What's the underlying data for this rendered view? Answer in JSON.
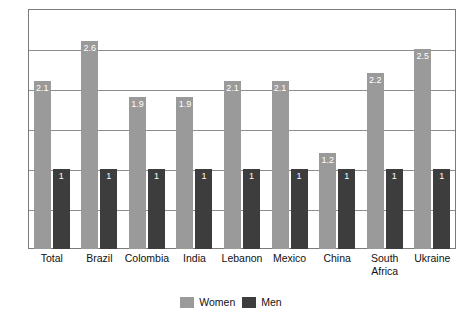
{
  "chart_data": {
    "type": "bar",
    "title": "",
    "xlabel": "",
    "ylabel": "Odds Ratio of Major Depressive Episode",
    "ylim": [
      0,
      3.0
    ],
    "grid": true,
    "grid_interval": 0.5,
    "y_tick_labels": [],
    "legend_position": "bottom-center",
    "categories": [
      "Total",
      "Brazil",
      "Colombia",
      "India",
      "Lebanon",
      "Mexico",
      "China",
      "South\nAfrica",
      "Ukraine"
    ],
    "series": [
      {
        "name": "Women",
        "color": "#9a9a9a",
        "values": [
          2.1,
          2.6,
          1.9,
          1.9,
          2.1,
          2.1,
          1.2,
          2.2,
          2.5
        ],
        "labels": [
          "2.1",
          "2.6",
          "1.9",
          "1.9",
          "2.1",
          "2.1",
          "1.2",
          "2.2",
          "2.5"
        ]
      },
      {
        "name": "Men",
        "color": "#3d3d3d",
        "values": [
          1,
          1,
          1,
          1,
          1,
          1,
          1,
          1,
          1
        ],
        "labels": [
          "1",
          "1",
          "1",
          "1",
          "1",
          "1",
          "1",
          "1",
          "1"
        ]
      }
    ]
  },
  "legend": {
    "items": [
      {
        "label": "Women",
        "color": "#9a9a9a"
      },
      {
        "label": "Men",
        "color": "#3d3d3d"
      }
    ]
  },
  "colors": {
    "women": "#9a9a9a",
    "men": "#3d3d3d",
    "gridline": "#8d8d8d",
    "frame": "#7b7b7b",
    "text": "#111111",
    "data_label": "#ffffff"
  }
}
